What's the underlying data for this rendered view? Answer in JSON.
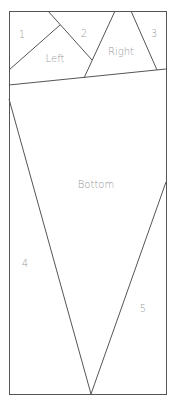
{
  "diagram": {
    "type": "paper-piecing-pattern",
    "regions": [
      {
        "id": "region-1",
        "label": "1"
      },
      {
        "id": "region-left",
        "label": "Left"
      },
      {
        "id": "region-2",
        "label": "2"
      },
      {
        "id": "region-right",
        "label": "Right"
      },
      {
        "id": "region-3",
        "label": "3"
      },
      {
        "id": "region-bottom",
        "label": "Bottom"
      },
      {
        "id": "region-4",
        "label": "4"
      },
      {
        "id": "region-5",
        "label": "5"
      }
    ],
    "colors": {
      "line": "#555555",
      "label": "#9a9a9a",
      "background": "#ffffff"
    }
  }
}
